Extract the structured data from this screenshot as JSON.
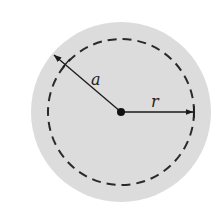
{
  "diagram": {
    "type": "circle-radius-diagram",
    "colors": {
      "background": "#ffffff",
      "disk_fill": "#dcdcdc",
      "stroke": "#1a1a1a"
    },
    "outer_circle": {
      "cx": 121,
      "cy": 112,
      "r": 90
    },
    "dashed_circle": {
      "cx": 121,
      "cy": 112,
      "r": 73
    },
    "center_point": {
      "cx": 121,
      "cy": 112,
      "r": 4
    },
    "arrows": [
      {
        "name": "radius-a",
        "label": "a",
        "from": [
          121,
          112
        ],
        "to": [
          54,
          55
        ]
      },
      {
        "name": "radius-r",
        "label": "r",
        "from": [
          121,
          112
        ],
        "to": [
          194,
          112
        ]
      }
    ],
    "labels": {
      "a": "a",
      "r": "r"
    }
  }
}
